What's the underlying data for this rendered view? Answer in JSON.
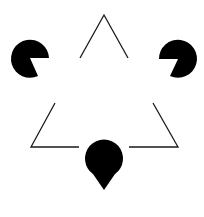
{
  "figure": {
    "background": "#ffffff",
    "foreground": "#000000",
    "pacmen": [
      {
        "name": "pacman-left",
        "cx": 30,
        "cy": 58,
        "r": 19,
        "mouth_from": [
          49,
          58
        ],
        "mouth_to": [
          38,
          76
        ]
      },
      {
        "name": "pacman-right",
        "cx": 178,
        "cy": 59,
        "r": 19,
        "mouth_from": [
          170,
          76
        ],
        "mouth_to": [
          159,
          59
        ]
      },
      {
        "name": "pacman-bottom",
        "cx": 104,
        "cy": 190,
        "r": 19,
        "mouth_from": [
          115,
          174
        ],
        "mouth_to": [
          93,
          174
        ]
      }
    ],
    "angles": [
      {
        "name": "angle-top",
        "points": [
          [
            80,
            58
          ],
          [
            104,
            15
          ],
          [
            128,
            58
          ]
        ]
      },
      {
        "name": "angle-bottom-left",
        "points": [
          [
            55,
            103
          ],
          [
            31,
            147
          ],
          [
            79,
            147
          ]
        ]
      },
      {
        "name": "angle-bottom-right",
        "points": [
          [
            153,
            103
          ],
          [
            178,
            147
          ],
          [
            129,
            147
          ]
        ]
      }
    ]
  }
}
